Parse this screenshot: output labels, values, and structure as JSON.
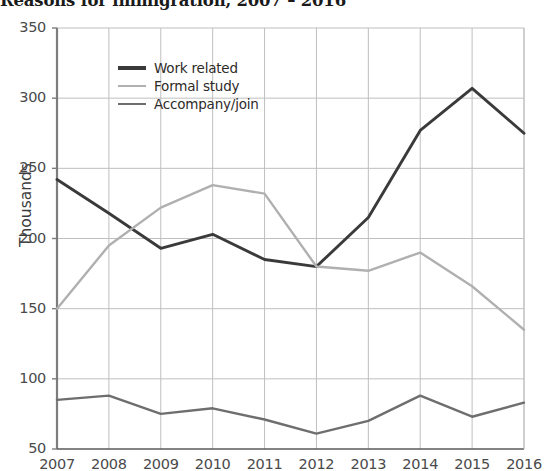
{
  "chart_data": {
    "type": "line",
    "title": "Reasons for immigration, 2007 – 2016",
    "xlabel": "",
    "ylabel": "Thousands",
    "ylim": [
      50,
      350
    ],
    "ytick_step": 50,
    "yticks": [
      "50",
      "100",
      "150",
      "200",
      "250",
      "300",
      "350"
    ],
    "grid": true,
    "legend_position": "upper-left-inside",
    "categories": [
      "2007",
      "2008",
      "2009",
      "2010",
      "2011",
      "2012",
      "2013",
      "2014",
      "2015",
      "2016"
    ],
    "x": [
      2007,
      2008,
      2009,
      2010,
      2011,
      2012,
      2013,
      2014,
      2015,
      2016
    ],
    "series": [
      {
        "name": "Work related",
        "color": "#3a3a3a",
        "values": [
          242,
          218,
          193,
          203,
          185,
          180,
          215,
          277,
          307,
          275
        ]
      },
      {
        "name": "Formal study",
        "color": "#b0b0b0",
        "values": [
          150,
          195,
          222,
          238,
          232,
          180,
          177,
          190,
          166,
          135
        ]
      },
      {
        "name": "Accompany/join",
        "color": "#6e6e6e",
        "values": [
          85,
          88,
          75,
          79,
          71,
          61,
          70,
          88,
          73,
          83
        ]
      }
    ]
  },
  "legend": {
    "items": [
      {
        "label": "Work related"
      },
      {
        "label": "Formal study"
      },
      {
        "label": "Accompany/join"
      }
    ]
  },
  "axes": {
    "y_title": "Thousands"
  },
  "colors": {
    "work_related": "#3a3a3a",
    "formal_study": "#b0b0b0",
    "accompany_join": "#6e6e6e",
    "grid": "#bfbfbf",
    "axis": "#8a8a8a",
    "text": "#4a4a4a"
  }
}
